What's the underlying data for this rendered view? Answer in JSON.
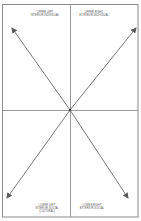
{
  "diagram": {
    "type": "four-quadrant",
    "colors": {
      "frame": "#8a8a8a",
      "divider": "#9a9a9a",
      "arrow": "#6a6a6a",
      "text": "#555555",
      "background": "#ffffff"
    },
    "quadrants": {
      "upper_left": {
        "line1": "UPPER LEFT",
        "line2": "INTERIOR-INDIVIDUAL"
      },
      "upper_right": {
        "line1": "UPPER RIGHT",
        "line2": "EXTERIOR-INDIVIDUAL"
      },
      "lower_left": {
        "line1": "LOWER LEFT",
        "line2": "INTERIOR-SOCIAL",
        "line3": "(CULTURAL)"
      },
      "lower_right": {
        "line1": "LOWER RIGHT",
        "line2": "EXTERIOR-SOCIAL"
      }
    },
    "arrows": [
      {
        "name": "upper-left",
        "from": [
          70,
          110
        ],
        "to": [
          12,
          28
        ]
      },
      {
        "name": "upper-right",
        "from": [
          70,
          110
        ],
        "to": [
          136,
          28
        ]
      },
      {
        "name": "lower-left",
        "from": [
          70,
          110
        ],
        "to": [
          7,
          198
        ]
      },
      {
        "name": "lower-right",
        "from": [
          70,
          110
        ],
        "to": [
          128,
          198
        ]
      }
    ]
  }
}
